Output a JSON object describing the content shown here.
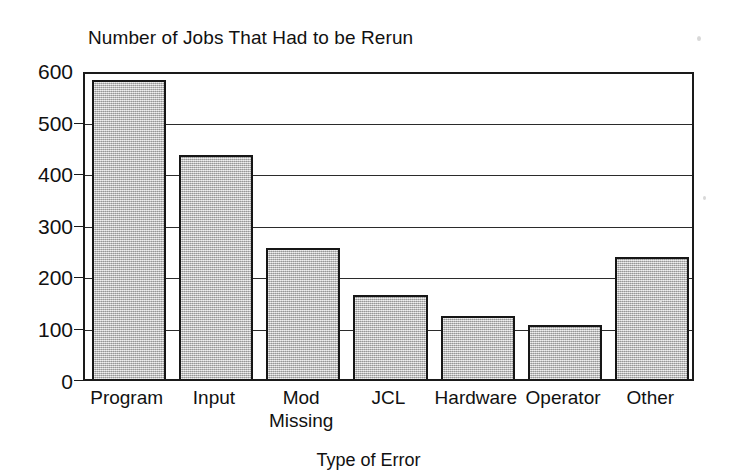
{
  "chart_data": {
    "type": "bar",
    "title": "Number of Jobs That Had to be Rerun",
    "xlabel": "Type of Error",
    "ylabel": "",
    "categories": [
      "Program",
      "Input",
      "Mod\nMissing",
      "JCL",
      "Hardware",
      "Operator",
      "Other"
    ],
    "values": [
      580,
      435,
      255,
      163,
      123,
      104,
      237
    ],
    "ylim": [
      0,
      600
    ],
    "yticks": [
      0,
      100,
      200,
      300,
      400,
      500,
      600
    ],
    "ytick_labels": [
      "0",
      "100",
      "200",
      "300",
      "400",
      "500",
      "600"
    ],
    "grid": true,
    "grid_axis": "y",
    "legend": false,
    "bar_fill_color": "#b9b9b9",
    "bar_edge_color": "#161616",
    "axis_color": "#1a1a1a",
    "background_color": "#ffffff"
  },
  "chart": {
    "title": "Number of Jobs That Had to be Rerun",
    "x_axis_title": "Type of Error",
    "y_ticks": [
      "600",
      "500",
      "400",
      "300",
      "200",
      "100",
      "0"
    ],
    "bars": [
      {
        "label": "Program",
        "value": 580
      },
      {
        "label": "Input",
        "value": 435
      },
      {
        "label": "Mod\nMissing",
        "value": 255
      },
      {
        "label": "JCL",
        "value": 163
      },
      {
        "label": "Hardware",
        "value": 123
      },
      {
        "label": "Operator",
        "value": 104
      },
      {
        "label": "Other",
        "value": 237
      }
    ]
  }
}
